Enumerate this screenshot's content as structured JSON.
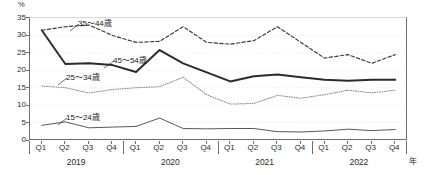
{
  "chart_data": {
    "type": "line",
    "title": "",
    "subtitle": "",
    "xlabel": "年",
    "ylabel": "%",
    "ylim": [
      0,
      35
    ],
    "yticks": [
      0,
      5,
      10,
      15,
      20,
      25,
      30,
      35
    ],
    "grid": true,
    "legend_position": "inline-annotations",
    "x": [
      "Q1",
      "Q2",
      "Q3",
      "Q4",
      "Q1",
      "Q2",
      "Q3",
      "Q4",
      "Q1",
      "Q2",
      "Q3",
      "Q4",
      "Q1",
      "Q2",
      "Q3",
      "Q4"
    ],
    "x_groups": [
      {
        "label": "2019",
        "quarters": [
          "Q1",
          "Q2",
          "Q3",
          "Q4"
        ]
      },
      {
        "label": "2020",
        "quarters": [
          "Q1",
          "Q2",
          "Q3",
          "Q4"
        ]
      },
      {
        "label": "2021",
        "quarters": [
          "Q1",
          "Q2",
          "Q3",
          "Q4"
        ]
      },
      {
        "label": "2022",
        "quarters": [
          "Q1",
          "Q2",
          "Q3",
          "Q4"
        ]
      }
    ],
    "series": [
      {
        "name": "35〜44歳",
        "style": "dashed",
        "color": "#3b3b3b",
        "values": [
          31.5,
          32.5,
          33.0,
          30.0,
          28.0,
          28.3,
          32.5,
          28.0,
          27.5,
          28.5,
          32.5,
          28.0,
          23.5,
          24.5,
          22.0,
          24.5
        ]
      },
      {
        "name": "45〜54歳",
        "style": "solid-thick",
        "color": "#2b2b2b",
        "values": [
          31.5,
          21.8,
          22.0,
          21.5,
          19.5,
          25.8,
          22.0,
          19.4,
          16.8,
          18.3,
          18.8,
          18.0,
          17.3,
          17.0,
          17.3,
          17.3
        ]
      },
      {
        "name": "25〜34歳",
        "style": "dotted",
        "color": "#8a8a8a",
        "values": [
          15.5,
          15.0,
          13.5,
          14.5,
          15.0,
          15.3,
          18.0,
          13.0,
          10.3,
          10.5,
          12.8,
          12.0,
          13.0,
          14.3,
          13.5,
          14.3
        ]
      },
      {
        "name": "15〜24歳",
        "style": "solid-thin",
        "color": "#3b3b3b",
        "values": [
          4.2,
          5.2,
          3.5,
          3.7,
          3.9,
          6.3,
          3.3,
          3.2,
          3.3,
          3.3,
          2.4,
          2.3,
          2.6,
          3.1,
          2.7,
          3.0
        ]
      }
    ],
    "annotations": [
      {
        "text": "35〜44歳",
        "series": "35〜44歳"
      },
      {
        "text": "45〜54歳",
        "series": "45〜54歳"
      },
      {
        "text": "25〜34歳",
        "series": "25〜34歳"
      },
      {
        "text": "15〜24歳",
        "series": "15〜24歳"
      }
    ]
  },
  "axis": {
    "y_unit": "%",
    "x_unit": "年",
    "yticks": [
      "35",
      "30",
      "25",
      "20",
      "15",
      "10",
      "5",
      "0"
    ]
  }
}
